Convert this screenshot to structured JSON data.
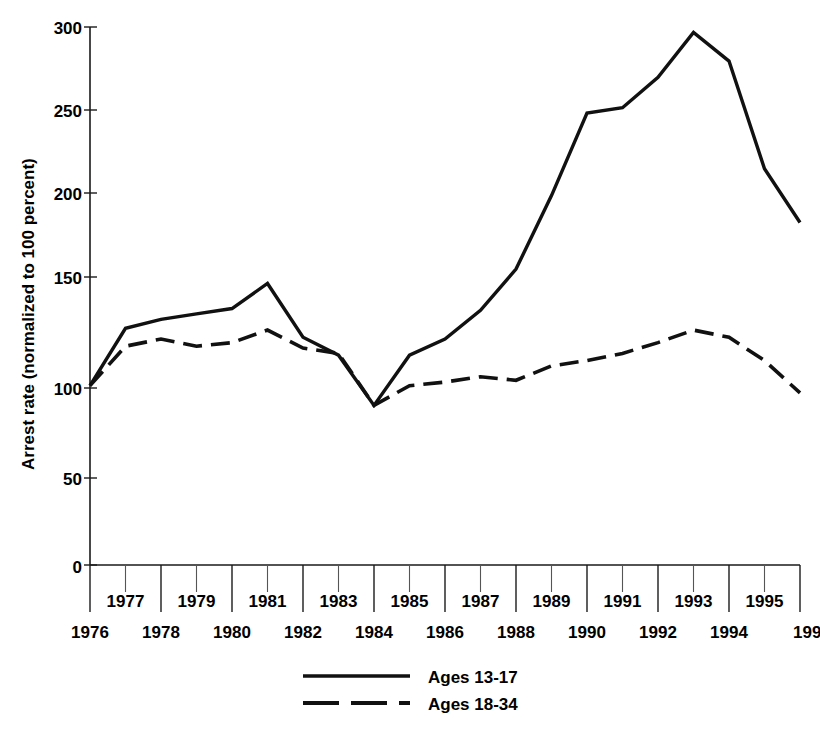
{
  "chart_data": {
    "type": "line",
    "title": "",
    "xlabel": "",
    "ylabel": "Arrest rate (normalized to 100 percent)",
    "ylim": [
      0,
      300
    ],
    "yticks": [
      0,
      50,
      100,
      150,
      200,
      250,
      300
    ],
    "ytick_labels": [
      "0",
      "50",
      "100",
      "150",
      "200",
      "250",
      "300"
    ],
    "grid": false,
    "legend_position": "bottom-center",
    "x": [
      1976,
      1977,
      1978,
      1979,
      1980,
      1981,
      1982,
      1983,
      1984,
      1985,
      1986,
      1987,
      1988,
      1989,
      1990,
      1991,
      1992,
      1993,
      1994,
      1995,
      1996
    ],
    "xtick_labels_upper": [
      "1977",
      "1979",
      "1981",
      "1983",
      "1985",
      "1987",
      "1989",
      "1991",
      "1993",
      "1995"
    ],
    "xtick_labels_lower": [
      "1976",
      "1978",
      "1980",
      "1982",
      "1984",
      "1986",
      "1988",
      "1990",
      "1992",
      "1994",
      "199"
    ],
    "xtick_last_truncated": true,
    "series": [
      {
        "name": "Ages 13-17",
        "style": "solid",
        "values": [
          100,
          132,
          137,
          140,
          143,
          157,
          127,
          117,
          89,
          117,
          126,
          142,
          165,
          206,
          252,
          255,
          272,
          297,
          281,
          221,
          191
        ]
      },
      {
        "name": "Ages 18-34",
        "style": "dashed",
        "values": [
          100,
          122,
          126,
          122,
          124,
          131,
          121,
          118,
          89,
          100,
          102,
          105,
          103,
          111,
          114,
          118,
          124,
          131,
          127,
          114,
          96
        ]
      }
    ]
  },
  "legend": {
    "items": [
      {
        "label": "Ages 13-17",
        "style": "solid"
      },
      {
        "label": "Ages 18-34",
        "style": "dashed"
      }
    ]
  },
  "colors": {
    "line": "#111111",
    "axis": "#1a1a1a",
    "background": "#ffffff",
    "text": "#000000"
  }
}
